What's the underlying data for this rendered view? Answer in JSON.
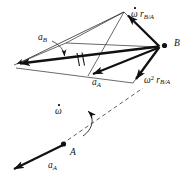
{
  "figure": {
    "type": "vector-diagram",
    "background_color": "#ffffff",
    "ink_color": "#111111",
    "width": 194,
    "height": 179
  },
  "points": [
    {
      "id": "B",
      "label": "B",
      "x": 160,
      "y": 47,
      "marker": "filled-dot"
    },
    {
      "id": "A",
      "label": "A",
      "x": 63,
      "y": 145,
      "marker": "filled-dot"
    }
  ],
  "labels": {
    "omega_dot_r_ba": {
      "omega": "ω",
      "space": " ",
      "r": "r",
      "sub": "B/A"
    },
    "omega_sq_r_ba": {
      "omega": "ω",
      "sup": "2",
      "space": " ",
      "r": "r",
      "sub": "B/A"
    },
    "a_b": {
      "base": "a",
      "sub": "B"
    },
    "a_a_mid": {
      "base": "a",
      "sub": "A"
    },
    "a_a_bottom": {
      "base": "a",
      "sub": "A"
    },
    "omega_dot_point": {
      "omega": "ω"
    },
    "point_b": "B",
    "point_a": "A"
  },
  "vectors": [
    {
      "name": "omega-dot-r-ba",
      "from": [
        160,
        47
      ],
      "to": [
        124,
        12
      ],
      "weight": "heavy",
      "arrow": true
    },
    {
      "name": "omega-squared-r-ba",
      "from": [
        160,
        47
      ],
      "to": [
        133,
        83
      ],
      "weight": "heavy",
      "arrow": true
    },
    {
      "name": "a-b-resultant",
      "from": [
        160,
        47
      ],
      "to": [
        12,
        66
      ],
      "weight": "heavy",
      "arrow": true
    },
    {
      "name": "a-a-translated",
      "from": [
        160,
        47
      ],
      "to": [
        87,
        77
      ],
      "weight": "heavy",
      "arrow": true
    },
    {
      "name": "a-a-base",
      "from": [
        63,
        145
      ],
      "to": [
        8,
        172
      ],
      "weight": "heavy",
      "arrow": true
    },
    {
      "name": "a-b-secondary",
      "from": [
        124,
        12
      ],
      "to": [
        12,
        66
      ],
      "weight": "light",
      "arrow": true
    },
    {
      "name": "parallelogram-upper-left",
      "from": [
        124,
        12
      ],
      "to": [
        66,
        43
      ],
      "weight": "light",
      "arrow": false
    },
    {
      "name": "parallelogram-left-lower",
      "from": [
        66,
        43
      ],
      "to": [
        12,
        66
      ],
      "weight": "light",
      "arrow": false
    },
    {
      "name": "parallelogram-mid-to-b",
      "from": [
        66,
        43
      ],
      "to": [
        160,
        47
      ],
      "weight": "light",
      "arrow": false
    },
    {
      "name": "parallelogram-lower-chord",
      "from": [
        12,
        66
      ],
      "to": [
        133,
        83
      ],
      "weight": "light",
      "arrow": false
    },
    {
      "name": "parallelogram-lower-right",
      "from": [
        133,
        83
      ],
      "to": [
        160,
        47
      ],
      "weight": "light",
      "arrow": false
    },
    {
      "name": "parallelogram-cross",
      "from": [
        87,
        77
      ],
      "to": [
        124,
        12
      ],
      "weight": "light",
      "arrow": false
    }
  ],
  "dashed_lines": [
    {
      "name": "relative-position-line-ab",
      "from": [
        63,
        145
      ],
      "to": [
        140,
        92
      ]
    },
    {
      "name": "angular-accel-arc",
      "description": "curved arrow about the AB axis"
    }
  ],
  "tick_marks": {
    "name": "equal-length-ticks",
    "count": 2,
    "x": 79,
    "y": 60,
    "note": "double hash marks indicating equal vectors"
  },
  "leader_lines": [
    {
      "name": "a-b-leader",
      "from": [
        52,
        41
      ],
      "to": [
        66,
        58
      ]
    }
  ]
}
